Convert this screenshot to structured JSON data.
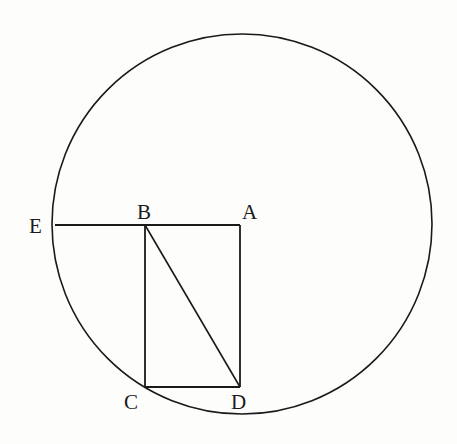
{
  "diagram": {
    "type": "geometry",
    "circle": {
      "cx": 242,
      "cy": 224,
      "r": 190
    },
    "points": {
      "A": {
        "label": "A",
        "x": 240,
        "y": 225
      },
      "B": {
        "label": "B",
        "x": 145,
        "y": 225
      },
      "C": {
        "label": "C",
        "x": 145,
        "y": 387
      },
      "D": {
        "label": "D",
        "x": 240,
        "y": 387
      },
      "E": {
        "label": "E",
        "x": 55,
        "y": 225
      }
    },
    "segments": [
      {
        "from": "E",
        "to": "A"
      },
      {
        "from": "A",
        "to": "D"
      },
      {
        "from": "D",
        "to": "C"
      },
      {
        "from": "C",
        "to": "B"
      },
      {
        "from": "B",
        "to": "D"
      }
    ],
    "colors": {
      "ink": "#1a1a1a",
      "background": "#fdfdfb"
    }
  }
}
